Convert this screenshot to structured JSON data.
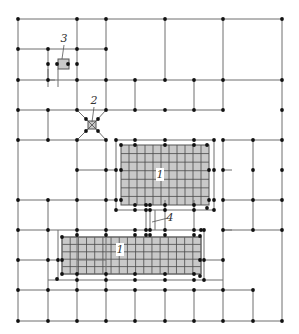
{
  "diagram": {
    "type": "mesh-grid-with-refined-zones",
    "colors": {
      "line": "#6e6e6e",
      "node": "#111111",
      "zone_fill": "#c9c9c9",
      "zone_stroke": "#555555"
    },
    "labels": [
      {
        "id": "label-1-upper",
        "text": "1",
        "x": 160,
        "y": 178
      },
      {
        "id": "label-1-lower",
        "text": "1",
        "x": 120,
        "y": 253
      },
      {
        "id": "label-2",
        "text": "2",
        "x": 94,
        "y": 104
      },
      {
        "id": "label-3",
        "text": "3",
        "x": 64,
        "y": 42
      },
      {
        "id": "label-4",
        "text": "4",
        "x": 170,
        "y": 221
      }
    ],
    "lines": [
      [
        18,
        19,
        282,
        19
      ],
      [
        18,
        49,
        106,
        49
      ],
      [
        18,
        80,
        282,
        80
      ],
      [
        18,
        110,
        223,
        110
      ],
      [
        18,
        140,
        106,
        140
      ],
      [
        223,
        140,
        282,
        140
      ],
      [
        77,
        170,
        106,
        170
      ],
      [
        18,
        200,
        106,
        200
      ],
      [
        223,
        200,
        282,
        200
      ],
      [
        18,
        230,
        48,
        230
      ],
      [
        223,
        230,
        282,
        230
      ],
      [
        18,
        260,
        48,
        260
      ],
      [
        77,
        260,
        106,
        260
      ],
      [
        18,
        290,
        253,
        290
      ],
      [
        18,
        321,
        282,
        321
      ],
      [
        18,
        19,
        18,
        321
      ],
      [
        77,
        19,
        77,
        110
      ],
      [
        106,
        19,
        106,
        110
      ],
      [
        165,
        19,
        165,
        80
      ],
      [
        223,
        19,
        223,
        110
      ],
      [
        282,
        19,
        282,
        321
      ],
      [
        48,
        49,
        48,
        80
      ],
      [
        135,
        80,
        135,
        110
      ],
      [
        194,
        80,
        194,
        110
      ],
      [
        48,
        110,
        48,
        140
      ],
      [
        77,
        140,
        77,
        290
      ],
      [
        106,
        140,
        106,
        290
      ],
      [
        48,
        200,
        48,
        321
      ],
      [
        77,
        290,
        77,
        321
      ],
      [
        106,
        290,
        106,
        321
      ],
      [
        135,
        290,
        135,
        321
      ],
      [
        165,
        290,
        165,
        321
      ],
      [
        194,
        290,
        194,
        321
      ],
      [
        223,
        290,
        223,
        321
      ],
      [
        253,
        290,
        253,
        321
      ],
      [
        223,
        140,
        223,
        290
      ],
      [
        253,
        140,
        253,
        230
      ],
      [
        165,
        200,
        165,
        230
      ],
      [
        194,
        200,
        194,
        230
      ],
      [
        106,
        200,
        116,
        200
      ],
      [
        106,
        170,
        116,
        170
      ],
      [
        223,
        170,
        232,
        170
      ],
      [
        223,
        230,
        232,
        230
      ],
      [
        48,
        80,
        55,
        80
      ],
      [
        58,
        69,
        58,
        87
      ],
      [
        48,
        69,
        48,
        87
      ],
      [
        77,
        110,
        88,
        121
      ],
      [
        106,
        110,
        96,
        121
      ],
      [
        77,
        140,
        88,
        129
      ],
      [
        106,
        140,
        96,
        129
      ],
      [
        116,
        140,
        116,
        210
      ],
      [
        116,
        140,
        214,
        140
      ],
      [
        214,
        140,
        214,
        210
      ],
      [
        116,
        210,
        214,
        210
      ],
      [
        62,
        237,
        62,
        274
      ],
      [
        62,
        237,
        201,
        237
      ],
      [
        201,
        237,
        201,
        274
      ],
      [
        62,
        274,
        201,
        274
      ],
      [
        58,
        230,
        204,
        230
      ],
      [
        58,
        280,
        204,
        280
      ],
      [
        58,
        230,
        58,
        280
      ],
      [
        204,
        230,
        204,
        280
      ],
      [
        48,
        230,
        58,
        230
      ],
      [
        48,
        260,
        58,
        260
      ],
      [
        48,
        280,
        58,
        280
      ],
      [
        204,
        260,
        223,
        260
      ],
      [
        204,
        280,
        223,
        280
      ],
      [
        146,
        210,
        146,
        230
      ],
      [
        150,
        210,
        150,
        230
      ],
      [
        155,
        210,
        155,
        230
      ]
    ],
    "zones": [
      {
        "id": "zone-1-upper",
        "x": 121,
        "y": 145,
        "w": 88,
        "h": 60,
        "nx": 11,
        "ny": 7
      },
      {
        "id": "zone-1-lower",
        "x": 62,
        "y": 237,
        "w": 139,
        "h": 37,
        "nx": 17,
        "ny": 5
      },
      {
        "id": "zone-2",
        "x": 88,
        "y": 121,
        "w": 8,
        "h": 8,
        "nx": 1,
        "ny": 1,
        "cross": true
      },
      {
        "id": "zone-3",
        "x": 58,
        "y": 59,
        "w": 11,
        "h": 10,
        "nx": 1,
        "ny": 1
      }
    ],
    "nodes": [
      [
        18,
        19
      ],
      [
        77,
        19
      ],
      [
        106,
        19
      ],
      [
        165,
        19
      ],
      [
        223,
        19
      ],
      [
        282,
        19
      ],
      [
        18,
        49
      ],
      [
        48,
        49
      ],
      [
        77,
        49
      ],
      [
        106,
        49
      ],
      [
        48,
        64
      ],
      [
        77,
        64
      ],
      [
        57,
        64
      ],
      [
        68,
        64
      ],
      [
        18,
        80
      ],
      [
        48,
        80
      ],
      [
        77,
        80
      ],
      [
        106,
        80
      ],
      [
        135,
        80
      ],
      [
        165,
        80
      ],
      [
        194,
        80
      ],
      [
        223,
        80
      ],
      [
        282,
        80
      ],
      [
        18,
        110
      ],
      [
        48,
        110
      ],
      [
        77,
        110
      ],
      [
        106,
        110
      ],
      [
        135,
        110
      ],
      [
        165,
        110
      ],
      [
        194,
        110
      ],
      [
        223,
        110
      ],
      [
        282,
        110
      ],
      [
        86,
        119
      ],
      [
        98,
        119
      ],
      [
        86,
        131
      ],
      [
        98,
        131
      ],
      [
        18,
        140
      ],
      [
        48,
        140
      ],
      [
        77,
        140
      ],
      [
        106,
        140
      ],
      [
        116,
        140
      ],
      [
        121,
        145
      ],
      [
        135,
        145
      ],
      [
        165,
        145
      ],
      [
        194,
        145
      ],
      [
        207,
        145
      ],
      [
        214,
        140
      ],
      [
        223,
        140
      ],
      [
        253,
        140
      ],
      [
        282,
        140
      ],
      [
        135,
        140
      ],
      [
        165,
        140
      ],
      [
        194,
        140
      ],
      [
        77,
        170
      ],
      [
        106,
        170
      ],
      [
        116,
        170
      ],
      [
        121,
        170
      ],
      [
        209,
        170
      ],
      [
        214,
        170
      ],
      [
        223,
        170
      ],
      [
        253,
        170
      ],
      [
        282,
        170
      ],
      [
        18,
        200
      ],
      [
        48,
        200
      ],
      [
        77,
        200
      ],
      [
        106,
        200
      ],
      [
        116,
        200
      ],
      [
        121,
        200
      ],
      [
        209,
        200
      ],
      [
        214,
        200
      ],
      [
        223,
        200
      ],
      [
        253,
        200
      ],
      [
        282,
        200
      ],
      [
        116,
        210
      ],
      [
        135,
        205
      ],
      [
        146,
        205
      ],
      [
        150,
        205
      ],
      [
        165,
        205
      ],
      [
        194,
        205
      ],
      [
        207,
        208
      ],
      [
        214,
        210
      ],
      [
        135,
        210
      ],
      [
        146,
        210
      ],
      [
        150,
        210
      ],
      [
        165,
        210
      ],
      [
        194,
        210
      ],
      [
        18,
        230
      ],
      [
        48,
        230
      ],
      [
        77,
        230
      ],
      [
        106,
        230
      ],
      [
        135,
        230
      ],
      [
        146,
        230
      ],
      [
        150,
        230
      ],
      [
        165,
        230
      ],
      [
        194,
        230
      ],
      [
        201,
        230
      ],
      [
        204,
        230
      ],
      [
        223,
        230
      ],
      [
        253,
        230
      ],
      [
        282,
        230
      ],
      [
        62,
        237
      ],
      [
        77,
        235
      ],
      [
        106,
        235
      ],
      [
        135,
        235
      ],
      [
        146,
        235
      ],
      [
        150,
        235
      ],
      [
        165,
        235
      ],
      [
        194,
        235
      ],
      [
        200,
        236
      ],
      [
        18,
        260
      ],
      [
        48,
        260
      ],
      [
        58,
        260
      ],
      [
        62,
        260
      ],
      [
        200,
        260
      ],
      [
        204,
        260
      ],
      [
        223,
        260
      ],
      [
        57,
        279
      ],
      [
        62,
        274
      ],
      [
        77,
        274
      ],
      [
        106,
        274
      ],
      [
        135,
        274
      ],
      [
        165,
        274
      ],
      [
        194,
        274
      ],
      [
        200,
        276
      ],
      [
        204,
        280
      ],
      [
        77,
        280
      ],
      [
        106,
        280
      ],
      [
        135,
        280
      ],
      [
        165,
        280
      ],
      [
        194,
        280
      ],
      [
        18,
        290
      ],
      [
        48,
        290
      ],
      [
        77,
        290
      ],
      [
        106,
        290
      ],
      [
        135,
        290
      ],
      [
        165,
        290
      ],
      [
        194,
        290
      ],
      [
        223,
        290
      ],
      [
        253,
        290
      ],
      [
        18,
        321
      ],
      [
        48,
        321
      ],
      [
        77,
        321
      ],
      [
        106,
        321
      ],
      [
        135,
        321
      ],
      [
        165,
        321
      ],
      [
        194,
        321
      ],
      [
        223,
        321
      ],
      [
        253,
        321
      ],
      [
        282,
        321
      ]
    ],
    "leaders": [
      {
        "id": "leader-2",
        "x1": 94,
        "y1": 107,
        "x2": 92,
        "y2": 122
      },
      {
        "id": "leader-3",
        "x1": 64,
        "y1": 45,
        "x2": 62,
        "y2": 59
      },
      {
        "id": "leader-4",
        "x1": 168,
        "y1": 218,
        "x2": 152,
        "y2": 222
      }
    ]
  }
}
